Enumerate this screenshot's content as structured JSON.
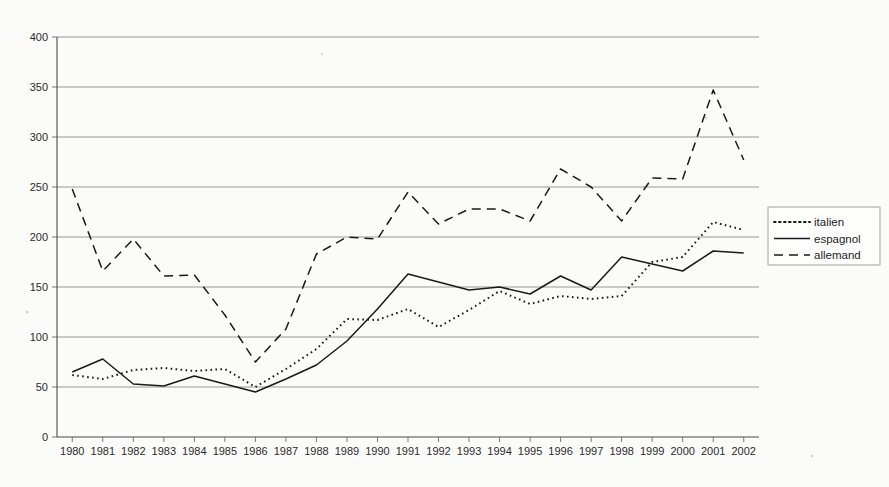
{
  "chart_data": {
    "type": "line",
    "title": "",
    "subtitle": "",
    "xlabel": "",
    "ylabel": "",
    "xlim": [
      1980,
      2002
    ],
    "ylim": [
      0,
      400
    ],
    "grid": true,
    "legend_position": "right",
    "categories": [
      "1980",
      "1981",
      "1982",
      "1983",
      "1984",
      "1985",
      "1986",
      "1987",
      "1988",
      "1989",
      "1990",
      "1991",
      "1992",
      "1993",
      "1994",
      "1995",
      "1996",
      "1997",
      "1998",
      "1999",
      "2000",
      "2001",
      "2002"
    ],
    "x_tick_labels": [
      "1980",
      "1981",
      "1982",
      "1983",
      "1984",
      "1985",
      "1986",
      "1987",
      "1988",
      "1989",
      "1990",
      "1991",
      "1992",
      "1993",
      "1994",
      "1995",
      "1996",
      "1997",
      "1998",
      "1999",
      "2000",
      "2001",
      "2002"
    ],
    "y_tick_labels": [
      "0",
      "50",
      "100",
      "150",
      "200",
      "250",
      "300",
      "350",
      "400"
    ],
    "y_ticks": [
      0,
      50,
      100,
      150,
      200,
      250,
      300,
      350,
      400
    ],
    "series": [
      {
        "name": "italien",
        "style": "dotted",
        "color": "#1a1a1a",
        "values": [
          62,
          58,
          67,
          69,
          66,
          68,
          50,
          68,
          88,
          118,
          117,
          128,
          110,
          127,
          146,
          133,
          141,
          138,
          141,
          175,
          180,
          215,
          207
        ]
      },
      {
        "name": "espagnol",
        "style": "solid",
        "color": "#1a1a1a",
        "values": [
          65,
          78,
          53,
          51,
          61,
          53,
          45,
          58,
          72,
          96,
          128,
          163,
          155,
          147,
          150,
          143,
          161,
          147,
          180,
          173,
          166,
          186,
          184
        ]
      },
      {
        "name": "allemand",
        "style": "dashed",
        "color": "#1a1a1a",
        "values": [
          248,
          166,
          198,
          161,
          162,
          122,
          75,
          108,
          183,
          200,
          198,
          245,
          213,
          228,
          228,
          216,
          268,
          250,
          216,
          259,
          258,
          347,
          277
        ]
      }
    ]
  },
  "legend": {
    "entries": [
      {
        "label": "italien",
        "style": "dotted"
      },
      {
        "label": "espagnol",
        "style": "solid"
      },
      {
        "label": "allemand",
        "style": "dashed"
      }
    ]
  },
  "colors": {
    "background": "#fbfbf9",
    "gridline": "#8d8d8d",
    "axis": "#4a4a4a",
    "series": "#1a1a1a"
  }
}
